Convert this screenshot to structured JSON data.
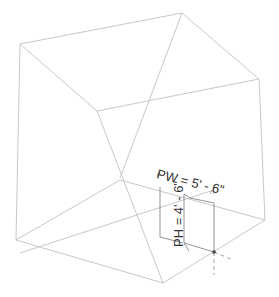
{
  "viewport": {
    "background": "#ffffff",
    "edge_color": "#c8c8c8",
    "dim_color": "#555555"
  },
  "model": {
    "edges": [
      {
        "x1": 20,
        "y1": 44,
        "x2": 182,
        "y2": 13
      },
      {
        "x1": 182,
        "y1": 13,
        "x2": 259,
        "y2": 79
      },
      {
        "x1": 20,
        "y1": 44,
        "x2": 97,
        "y2": 111
      },
      {
        "x1": 97,
        "y1": 111,
        "x2": 259,
        "y2": 79
      },
      {
        "x1": 182,
        "y1": 13,
        "x2": 120,
        "y2": 178
      },
      {
        "x1": 20,
        "y1": 44,
        "x2": 16,
        "y2": 240
      },
      {
        "x1": 259,
        "y1": 79,
        "x2": 265,
        "y2": 220
      },
      {
        "x1": 97,
        "y1": 111,
        "x2": 163,
        "y2": 283
      },
      {
        "x1": 16,
        "y1": 240,
        "x2": 120,
        "y2": 180
      },
      {
        "x1": 120,
        "y1": 180,
        "x2": 265,
        "y2": 220
      },
      {
        "x1": 16,
        "y1": 240,
        "x2": 163,
        "y2": 283
      },
      {
        "x1": 163,
        "y1": 283,
        "x2": 265,
        "y2": 220
      },
      {
        "x1": 20,
        "y1": 253,
        "x2": 214,
        "y2": 190
      }
    ]
  },
  "opening": {
    "width_label": "PW = 5' - 6\"",
    "height_label": "PH = 4' - 6\"",
    "anchor_point": {
      "x": 214,
      "y": 252
    }
  }
}
